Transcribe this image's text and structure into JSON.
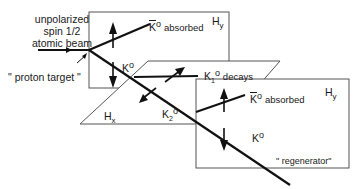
{
  "diagram": {
    "type": "physics-schematic",
    "source_labels": {
      "beam_line1": "unpolarized",
      "beam_line2": "spin 1/2",
      "beam_line3": "atomic beam",
      "target": "\" proton target \""
    },
    "planes": {
      "upper_left": "H",
      "upper_left_sub": "y",
      "middle": "H",
      "middle_sub": "x",
      "lower_right": "H",
      "lower_right_sub": "y"
    },
    "particles": {
      "kbar_absorbed_1": {
        "symbol": "K",
        "sup": "o",
        "text": "absorbed"
      },
      "k0_1": {
        "symbol": "K",
        "sup": "o"
      },
      "k1_decays": {
        "symbol": "K",
        "sub": "1",
        "sup": "o",
        "text": "decays"
      },
      "k2": {
        "symbol": "K",
        "sub": "2",
        "sup": "o"
      },
      "kbar_absorbed_2": {
        "symbol": "K",
        "sup": "o",
        "text": "absorbed"
      },
      "k0_2": {
        "symbol": "K",
        "sup": "o"
      }
    },
    "regenerator": "\" regenerator\"",
    "colors": {
      "line": "#111111",
      "frame": "#555555",
      "background": "#ffffff"
    }
  }
}
